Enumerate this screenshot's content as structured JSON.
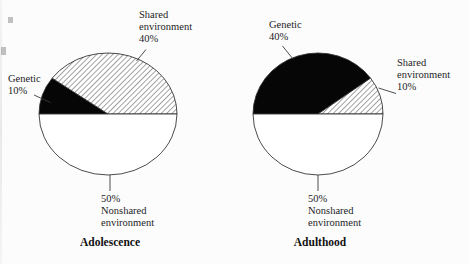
{
  "figure": {
    "background": "#fcfcfc",
    "ink_color": "#1c1c1c",
    "black_fill": "#060606",
    "hatch_line_color": "#1a1a1a"
  },
  "chart_data": [
    {
      "type": "pie",
      "title": "Adolescence",
      "start_angle_deg": 180,
      "direction": "clockwise",
      "slices": [
        {
          "label": "Genetic",
          "value": 10,
          "pattern": "solid-black"
        },
        {
          "label": "Shared environment",
          "value": 40,
          "pattern": "diagonal-hatch"
        },
        {
          "label": "Nonshared environment",
          "value": 50,
          "pattern": "white"
        }
      ],
      "callouts": {
        "shared": [
          "Shared",
          "environment",
          "40%"
        ],
        "genetic": [
          "Genetic",
          "10%"
        ],
        "nonshared": [
          "50%",
          "Nonshared",
          "environment"
        ]
      }
    },
    {
      "type": "pie",
      "title": "Adulthood",
      "start_angle_deg": 180,
      "direction": "clockwise",
      "slices": [
        {
          "label": "Genetic",
          "value": 40,
          "pattern": "solid-black"
        },
        {
          "label": "Shared environment",
          "value": 10,
          "pattern": "diagonal-hatch"
        },
        {
          "label": "Nonshared environment",
          "value": 50,
          "pattern": "white"
        }
      ],
      "callouts": {
        "genetic": [
          "Genetic",
          "40%"
        ],
        "shared": [
          "Shared",
          "environment",
          "10%"
        ],
        "nonshared": [
          "50%",
          "Nonshared",
          "environment"
        ]
      }
    }
  ]
}
